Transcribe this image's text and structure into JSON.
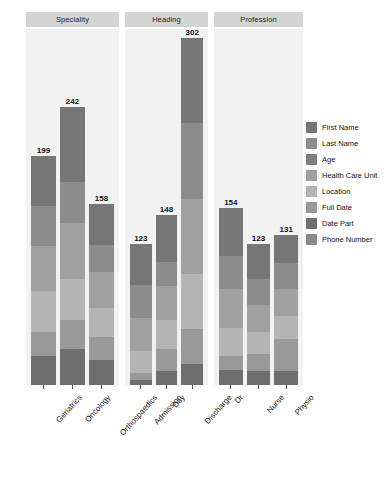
{
  "chart_data": {
    "type": "bar",
    "subtype": "stacked-bar",
    "title": "",
    "xlabel": "",
    "ylabel": "",
    "ylim": [
      0,
      310
    ],
    "grid": false,
    "legend_position": "right",
    "facets": [
      {
        "name": "Speciality",
        "categories": [
          "Geriatrics",
          "Oncology",
          "Orthospaedics"
        ],
        "totals": [
          199,
          242,
          158
        ]
      },
      {
        "name": "Heading",
        "categories": [
          "Admission",
          "Day",
          "Discharge"
        ],
        "totals": [
          123,
          148,
          302
        ]
      },
      {
        "name": "Profession",
        "categories": [
          "Dr",
          "Nurse",
          "Physio"
        ],
        "totals": [
          154,
          123,
          131
        ]
      }
    ],
    "series": [
      {
        "name": "First Name",
        "color": "#767676"
      },
      {
        "name": "Last Name",
        "color": "#8c8c8c"
      },
      {
        "name": "Age",
        "color": "#7d7d7d"
      },
      {
        "name": "Health Care Unit",
        "color": "#a0a0a0"
      },
      {
        "name": "Location",
        "color": "#b4b4b4"
      },
      {
        "name": "Full Date",
        "color": "#999999"
      },
      {
        "name": "Date Part",
        "color": "#6e6e6e"
      },
      {
        "name": "Phone Number",
        "color": "#8a8a8a"
      }
    ],
    "stacks": {
      "Geriatrics": [
        43,
        35,
        0,
        39,
        36,
        21,
        25,
        0
      ],
      "Oncology": [
        65,
        36,
        0,
        49,
        35,
        26,
        31,
        0
      ],
      "Orthospaedics": [
        36,
        24,
        0,
        31,
        25,
        20,
        22,
        0
      ],
      "Admission": [
        36,
        29,
        0,
        28,
        20,
        6,
        4,
        0
      ],
      "Day": [
        41,
        21,
        0,
        29,
        26,
        19,
        12,
        0
      ],
      "Discharge": [
        74,
        66,
        0,
        65,
        48,
        31,
        18,
        0
      ],
      "Dr": [
        42,
        28,
        0,
        34,
        25,
        12,
        13,
        0
      ],
      "Nurse": [
        31,
        22,
        0,
        24,
        19,
        15,
        12,
        0
      ],
      "Physio": [
        25,
        22,
        0,
        24,
        20,
        28,
        12,
        0
      ]
    }
  },
  "panel_strips": [
    "Speciality",
    "Heading",
    "Profession"
  ],
  "legend": {
    "items": [
      {
        "label": "First Name",
        "color": "#767676"
      },
      {
        "label": "Last Name",
        "color": "#8c8c8c"
      },
      {
        "label": "Age",
        "color": "#7d7d7d"
      },
      {
        "label": "Health Care Unit",
        "color": "#a0a0a0"
      },
      {
        "label": "Location",
        "color": "#b4b4b4"
      },
      {
        "label": "Full Date",
        "color": "#999999"
      },
      {
        "label": "Date Part",
        "color": "#6e6e6e"
      },
      {
        "label": "Phone Number",
        "color": "#8a8a8a"
      }
    ]
  },
  "styling": {
    "panel_background": "#f2f2f2",
    "strip_background": "#d4d4d4",
    "page_background": "#ffffff"
  }
}
